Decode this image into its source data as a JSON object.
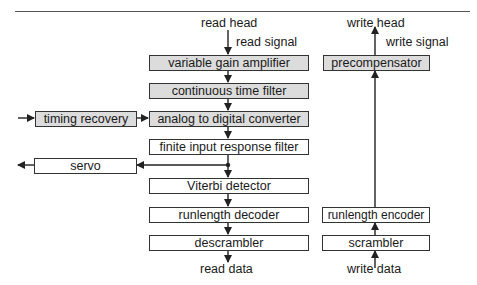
{
  "diagram": {
    "type": "block-diagram",
    "title": "",
    "read_path": {
      "input_label": "read head",
      "signal_label": "read signal",
      "blocks": [
        {
          "id": "vga",
          "label": "variable gain amplifier",
          "shaded": true
        },
        {
          "id": "ctf",
          "label": "continuous time filter",
          "shaded": true
        },
        {
          "id": "adc",
          "label": "analog to digital converter",
          "shaded": true
        },
        {
          "id": "fir",
          "label": "finite input response filter",
          "shaded": false
        },
        {
          "id": "viterbi",
          "label": "Viterbi detector",
          "shaded": false
        },
        {
          "id": "rll_dec",
          "label": "runlength decoder",
          "shaded": false
        },
        {
          "id": "descrambler",
          "label": "descrambler",
          "shaded": false
        }
      ],
      "output_label": "read data"
    },
    "side_blocks": {
      "timing_recovery": {
        "label": "timing recovery",
        "shaded": true
      },
      "servo": {
        "label": "servo",
        "shaded": false
      }
    },
    "write_path": {
      "input_label": "write data",
      "blocks": [
        {
          "id": "scrambler",
          "label": "scrambler",
          "shaded": false
        },
        {
          "id": "rll_enc",
          "label": "runlength encoder",
          "shaded": false
        },
        {
          "id": "precomp",
          "label": "precompensator",
          "shaded": true
        }
      ],
      "signal_label": "write signal",
      "output_label": "write head"
    },
    "colors": {
      "shaded_fill": "#dcdcdc",
      "line": "#333333"
    }
  }
}
